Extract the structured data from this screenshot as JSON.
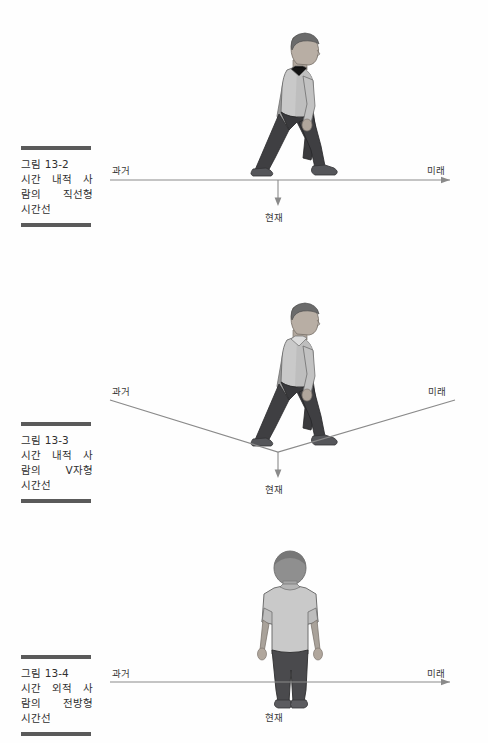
{
  "page": {
    "background": "#ffffff",
    "ink": "#2b2b2b",
    "rule_color": "#5a5a5a",
    "line_color": "#8a8a8a",
    "shirt_color": "#c9c9c9",
    "pants_color": "#4a4a4a",
    "skin_color": "#b8b0a8"
  },
  "figures": [
    {
      "id": "figure-13-2",
      "caption": {
        "number": "그림 13-2",
        "line2_a": "시간",
        "line2_b": "내적",
        "line2_c": "사",
        "line3_a": "람의",
        "line3_b": "직선형",
        "line4": "시간선"
      },
      "timeline": {
        "type": "straight",
        "past_label": "과거",
        "future_label": "미래",
        "present_label": "현재"
      },
      "person": {
        "pose": "walking-right-profile",
        "description": "측면으로 걷는 사람"
      }
    },
    {
      "id": "figure-13-3",
      "caption": {
        "number": "그림 13-3",
        "line2_a": "시간",
        "line2_b": "내적",
        "line2_c": "사",
        "line3_a": "람의",
        "line3_b": "V자형",
        "line4": "시간선"
      },
      "timeline": {
        "type": "v-shaped",
        "past_label": "과거",
        "future_label": "미래",
        "present_label": "현재"
      },
      "person": {
        "pose": "walking-right-profile",
        "description": "측면으로 걷는 사람"
      }
    },
    {
      "id": "figure-13-4",
      "caption": {
        "number": "그림 13-4",
        "line2_a": "시간",
        "line2_b": "외적",
        "line2_c": "사",
        "line3_a": "람의",
        "line3_b": "전방형",
        "line4": "시간선"
      },
      "timeline": {
        "type": "straight",
        "past_label": "과거",
        "future_label": "미래",
        "present_label": "현재"
      },
      "person": {
        "pose": "standing-back-view",
        "description": "뒤돌아 서 있는 사람"
      }
    }
  ]
}
